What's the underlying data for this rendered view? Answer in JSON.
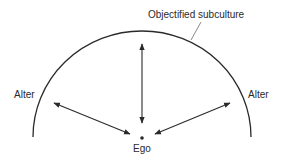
{
  "diagram": {
    "labels": {
      "subculture": "Objectified subculture",
      "alter_left": "Alter",
      "alter_right": "Alter",
      "ego": "Ego"
    },
    "colors": {
      "stroke": "#2a2a2a",
      "leader": "#6a6a6a",
      "background": "#ffffff"
    },
    "elements": {
      "boundary": "semicircular arc representing objectified subculture",
      "arrows": [
        {
          "from": "Ego",
          "to": "Objectified subculture",
          "type": "bidirectional"
        },
        {
          "from": "Ego",
          "to": "Alter (left)",
          "type": "bidirectional"
        },
        {
          "from": "Ego",
          "to": "Alter (right)",
          "type": "bidirectional"
        }
      ]
    }
  }
}
